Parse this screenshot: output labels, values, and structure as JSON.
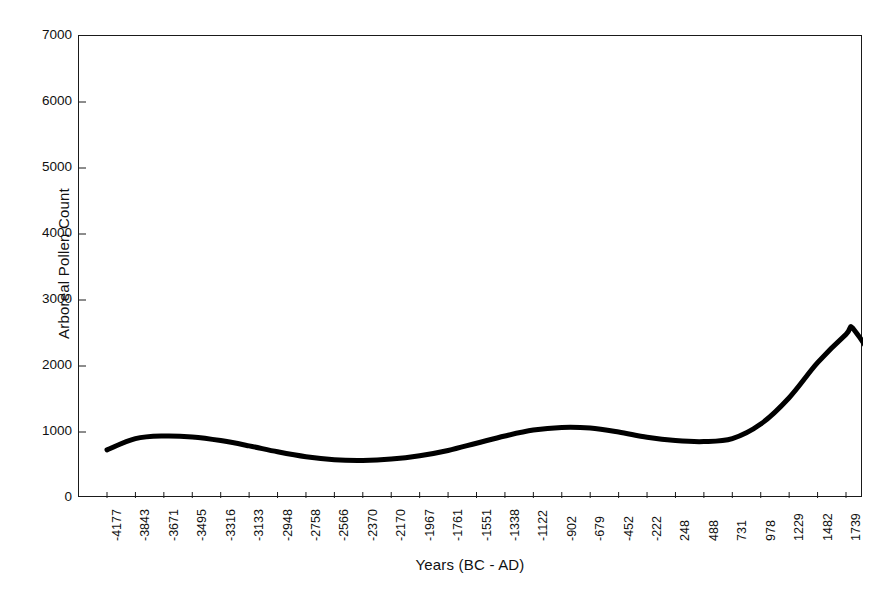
{
  "chart_data": {
    "type": "line",
    "title": "",
    "xlabel": "Years (BC - AD)",
    "ylabel": "Arboreal Pollen Count",
    "ylim": [
      0,
      7000
    ],
    "y_ticks": [
      0,
      1000,
      2000,
      3000,
      4000,
      5000,
      6000,
      7000
    ],
    "y_tick_labels": [
      "0",
      "1000",
      "2000",
      "3000",
      "4000",
      "5000",
      "6000",
      "7000"
    ],
    "grid": false,
    "legend": "none",
    "line_color": "#000000",
    "line_width": 5,
    "categories": [
      "-4177",
      "-3843",
      "-3671",
      "-3495",
      "-3316",
      "-3133",
      "-2948",
      "-2758",
      "-2566",
      "-2370",
      "-2170",
      "-1967",
      "-1761",
      "-1551",
      "-1338",
      "-1122",
      "-902",
      "-679",
      "-452",
      "-222",
      "248",
      "488",
      "731",
      "978",
      "1229",
      "1482",
      "1739"
    ],
    "x_tick_labels": [
      "-4177",
      "-3843",
      "-3671",
      "-3495",
      "-3316",
      "-3133",
      "-2948",
      "-2758",
      "-2566",
      "-2370",
      "-2170",
      "-1967",
      "-1761",
      "-1551",
      "-1338",
      "-1122",
      "-902",
      "-679",
      "-452",
      "-222",
      "248",
      "488",
      "731",
      "978",
      "1229",
      "1482",
      "1739"
    ],
    "values": [
      730,
      900,
      940,
      925,
      870,
      790,
      700,
      625,
      580,
      570,
      590,
      640,
      720,
      830,
      940,
      1030,
      1070,
      1060,
      1000,
      920,
      870,
      855,
      900,
      1120,
      1520,
      2050,
      2480
    ],
    "series": [
      {
        "name": "Arboreal Pollen Count",
        "values": [
          730,
          900,
          940,
          925,
          870,
          790,
          700,
          625,
          580,
          570,
          590,
          640,
          720,
          830,
          940,
          1030,
          1070,
          1060,
          1000,
          920,
          870,
          855,
          900,
          1120,
          1520,
          2050,
          2480
        ]
      }
    ],
    "annotations": {
      "start_value": 730,
      "first_peak_value": 940,
      "first_trough_value": 570,
      "mid_hump_value": 1070,
      "second_dip_value": 855,
      "max_peak_value": 2550,
      "end_value": 500
    }
  },
  "axis": {
    "y_title": "Arboreal Pollen Count",
    "x_title": "Years (BC - AD)"
  },
  "caption": {
    "text": ""
  }
}
